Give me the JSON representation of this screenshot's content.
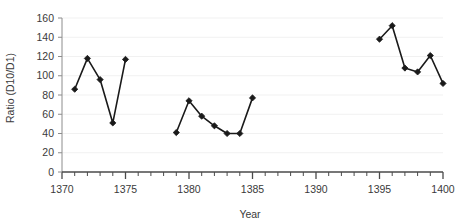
{
  "chart_data": {
    "type": "line",
    "title": "",
    "subtitle": "",
    "xlabel": "Year",
    "ylabel": "Ratio (D10/D1)",
    "xlim": [
      1370,
      1400
    ],
    "ylim": [
      0,
      160
    ],
    "grid": "horizontal-major",
    "legend": "none",
    "x_major_tick_step": 5,
    "x_minor_tick_step": 1,
    "y_tick_step": 20,
    "xticks": [
      "1370",
      "1375",
      "1380",
      "1385",
      "1390",
      "1395",
      "1400"
    ],
    "xtick_values": [
      1370,
      1375,
      1380,
      1385,
      1390,
      1395,
      1400
    ],
    "yticks": [
      "0",
      "20",
      "40",
      "60",
      "80",
      "100",
      "120",
      "140",
      "160"
    ],
    "ytick_values": [
      0,
      20,
      40,
      60,
      80,
      100,
      120,
      140,
      160
    ],
    "series": [
      {
        "name": "Ratio (D10/D1)",
        "marker": "diamond",
        "color": "#1a1a1a",
        "segments": [
          {
            "x": [
              1371,
              1372,
              1373,
              1374,
              1375
            ],
            "values": [
              86,
              118,
              96,
              51,
              117
            ]
          },
          {
            "x": [
              1379,
              1380,
              1381,
              1382,
              1383,
              1384,
              1385
            ],
            "values": [
              41,
              74,
              58,
              48,
              40,
              40,
              77
            ]
          },
          {
            "x": [
              1395,
              1396,
              1397,
              1398,
              1399,
              1400
            ],
            "values": [
              138,
              152,
              108,
              104,
              121,
              92
            ]
          }
        ]
      }
    ],
    "annotations": []
  },
  "colors": {
    "background": "#ffffff",
    "line": "#1a1a1a",
    "marker": "#1a1a1a",
    "gridline": "#f1f1f1",
    "axis": "#8c8c8c",
    "tick_label": "#3a3a3a"
  },
  "axes": {
    "x_title": "Year",
    "y_title": "Ratio (D10/D1)"
  }
}
